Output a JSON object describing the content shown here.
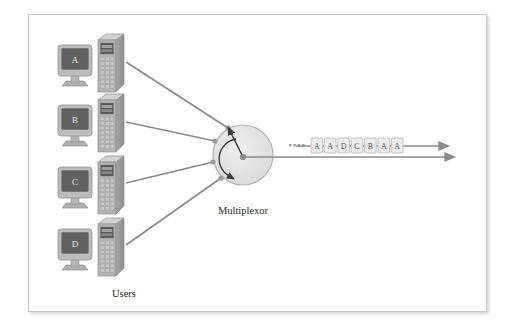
{
  "figure": {
    "background_color": "#ffffff",
    "frame_border_color": "#c9c9c9"
  },
  "labels": {
    "users": "Users",
    "multiplexor": "Multiplexor"
  },
  "terminals": [
    {
      "id": "terminal-a",
      "screen_label": "A",
      "x": 58,
      "y": 38
    },
    {
      "id": "terminal-b",
      "screen_label": "B",
      "x": 58,
      "y": 98
    },
    {
      "id": "terminal-c",
      "screen_label": "C",
      "x": 58,
      "y": 160
    },
    {
      "id": "terminal-d",
      "screen_label": "D",
      "x": 58,
      "y": 222
    }
  ],
  "multiplexor": {
    "center_x": 243,
    "center_y": 155,
    "radius": 30,
    "fill_color": "#e6e6e6",
    "stroke_color": "#b0b0b0",
    "ports": [
      {
        "name": "port-a",
        "x": 228,
        "y": 128
      },
      {
        "name": "port-b",
        "x": 215,
        "y": 141
      },
      {
        "name": "port-c",
        "x": 213,
        "y": 162
      },
      {
        "name": "port-d",
        "x": 221,
        "y": 178
      }
    ],
    "selector_arm_target": {
      "x": 230,
      "y": 130
    },
    "rotation_direction": "counter-clockwise"
  },
  "stream": {
    "leader_dots": 4,
    "packets": [
      "A",
      "A",
      "D",
      "C",
      "B",
      "A",
      "A"
    ],
    "packet_fill": "#ececec",
    "packet_stroke": "#bfbfbf",
    "arrow_color": "#8a8a8a"
  },
  "colors": {
    "line": "#8a8a8a",
    "monitor_body": "#bdbdbd",
    "monitor_screen": "#616161",
    "tower_front": "#b4b4b4",
    "tower_side": "#949494",
    "tower_top": "#d2d2d2",
    "text": "#231f20"
  }
}
